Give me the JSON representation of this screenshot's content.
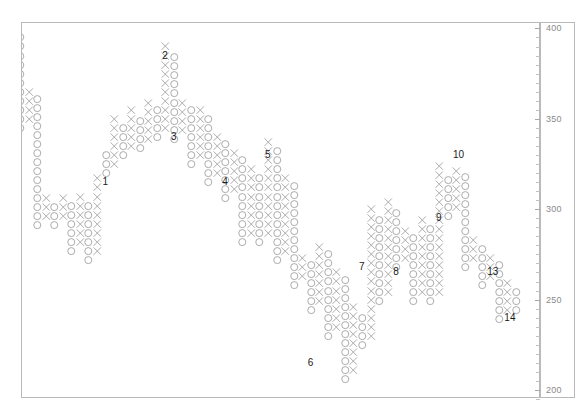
{
  "chart_data": {
    "type": "scatter",
    "chart_kind": "point-and-figure",
    "title": "",
    "xlabel": "",
    "ylabel": "",
    "ylim": [
      195,
      403
    ],
    "y_axis": {
      "position": "right",
      "major_ticks": [
        400,
        350,
        300,
        250,
        200
      ],
      "major_tick_labels": [
        "400",
        "350",
        "300",
        "250",
        "200"
      ],
      "minor_tick_step": 5,
      "grid": false,
      "box_size": 5,
      "reversal": 3
    },
    "x_axis": {
      "ticks": [],
      "tick_labels": [],
      "grid": false,
      "columns_total": 59
    },
    "symbols": {
      "up": "X",
      "down": "O"
    },
    "series_name": "",
    "annotations": [
      {
        "text": "1",
        "x": 10,
        "y": 315
      },
      {
        "text": "2",
        "x": 17,
        "y": 385
      },
      {
        "text": "3",
        "x": 18,
        "y": 340
      },
      {
        "text": "4",
        "x": 24,
        "y": 315
      },
      {
        "text": "5",
        "x": 29,
        "y": 330
      },
      {
        "text": "6",
        "x": 34,
        "y": 215
      },
      {
        "text": "7",
        "x": 40,
        "y": 268
      },
      {
        "text": "8",
        "x": 44,
        "y": 265
      },
      {
        "text": "9",
        "x": 49,
        "y": 295
      },
      {
        "text": "10",
        "x": 51,
        "y": 330
      },
      {
        "text": "13",
        "x": 55,
        "y": 265
      },
      {
        "text": "14",
        "x": 57,
        "y": 240
      }
    ],
    "columns": [
      {
        "dir": "O",
        "x": 0,
        "top": 399,
        "bottom": 345
      },
      {
        "dir": "X",
        "x": 1,
        "top": 369,
        "bottom": 350
      },
      {
        "dir": "O",
        "x": 2,
        "top": 364,
        "bottom": 291
      },
      {
        "dir": "X",
        "x": 3,
        "top": 310,
        "bottom": 296
      },
      {
        "dir": "O",
        "x": 4,
        "top": 305,
        "bottom": 291
      },
      {
        "dir": "X",
        "x": 5,
        "top": 310,
        "bottom": 296
      },
      {
        "dir": "O",
        "x": 6,
        "top": 305,
        "bottom": 277
      },
      {
        "dir": "X",
        "x": 7,
        "top": 310,
        "bottom": 282
      },
      {
        "dir": "O",
        "x": 8,
        "top": 305,
        "bottom": 272
      },
      {
        "dir": "X",
        "x": 9,
        "top": 320,
        "bottom": 277
      },
      {
        "dir": "O",
        "x": 10,
        "top": 334,
        "bottom": 320
      },
      {
        "dir": "X",
        "x": 11,
        "top": 353,
        "bottom": 325
      },
      {
        "dir": "O",
        "x": 12,
        "top": 348,
        "bottom": 330
      },
      {
        "dir": "X",
        "x": 13,
        "top": 358,
        "bottom": 335
      },
      {
        "dir": "O",
        "x": 14,
        "top": 353,
        "bottom": 334
      },
      {
        "dir": "X",
        "x": 15,
        "top": 363,
        "bottom": 339
      },
      {
        "dir": "O",
        "x": 16,
        "top": 358,
        "bottom": 340
      },
      {
        "dir": "X",
        "x": 17,
        "top": 392,
        "bottom": 345
      },
      {
        "dir": "O",
        "x": 18,
        "top": 387,
        "bottom": 339
      },
      {
        "dir": "X",
        "x": 19,
        "top": 363,
        "bottom": 344
      },
      {
        "dir": "O",
        "x": 20,
        "top": 358,
        "bottom": 325
      },
      {
        "dir": "X",
        "x": 21,
        "top": 358,
        "bottom": 330
      },
      {
        "dir": "O",
        "x": 22,
        "top": 353,
        "bottom": 315
      },
      {
        "dir": "X",
        "x": 23,
        "top": 344,
        "bottom": 320
      },
      {
        "dir": "O",
        "x": 24,
        "top": 339,
        "bottom": 306
      },
      {
        "dir": "X",
        "x": 25,
        "top": 334,
        "bottom": 311
      },
      {
        "dir": "O",
        "x": 26,
        "top": 329,
        "bottom": 282
      },
      {
        "dir": "X",
        "x": 27,
        "top": 325,
        "bottom": 287
      },
      {
        "dir": "O",
        "x": 28,
        "top": 320,
        "bottom": 282
      },
      {
        "dir": "X",
        "x": 29,
        "top": 339,
        "bottom": 287
      },
      {
        "dir": "O",
        "x": 30,
        "top": 334,
        "bottom": 272
      },
      {
        "dir": "X",
        "x": 31,
        "top": 320,
        "bottom": 277
      },
      {
        "dir": "O",
        "x": 32,
        "top": 315,
        "bottom": 258
      },
      {
        "dir": "X",
        "x": 33,
        "top": 277,
        "bottom": 263
      },
      {
        "dir": "O",
        "x": 34,
        "top": 272,
        "bottom": 244
      },
      {
        "dir": "X",
        "x": 35,
        "top": 282,
        "bottom": 249
      },
      {
        "dir": "O",
        "x": 36,
        "top": 277,
        "bottom": 230
      },
      {
        "dir": "X",
        "x": 37,
        "top": 268,
        "bottom": 235
      },
      {
        "dir": "O",
        "x": 38,
        "top": 263,
        "bottom": 206
      },
      {
        "dir": "X",
        "x": 39,
        "top": 249,
        "bottom": 211
      },
      {
        "dir": "O",
        "x": 40,
        "top": 244,
        "bottom": 225
      },
      {
        "dir": "X",
        "x": 41,
        "top": 301,
        "bottom": 230
      },
      {
        "dir": "O",
        "x": 42,
        "top": 296,
        "bottom": 249
      },
      {
        "dir": "X",
        "x": 43,
        "top": 306,
        "bottom": 254
      },
      {
        "dir": "O",
        "x": 44,
        "top": 301,
        "bottom": 268
      },
      {
        "dir": "X",
        "x": 45,
        "top": 291,
        "bottom": 273
      },
      {
        "dir": "O",
        "x": 46,
        "top": 287,
        "bottom": 249
      },
      {
        "dir": "X",
        "x": 47,
        "top": 296,
        "bottom": 254
      },
      {
        "dir": "O",
        "x": 48,
        "top": 291,
        "bottom": 249
      },
      {
        "dir": "X",
        "x": 49,
        "top": 325,
        "bottom": 254
      },
      {
        "dir": "O",
        "x": 50,
        "top": 320,
        "bottom": 296
      },
      {
        "dir": "X",
        "x": 51,
        "top": 325,
        "bottom": 301
      },
      {
        "dir": "O",
        "x": 52,
        "top": 320,
        "bottom": 268
      },
      {
        "dir": "X",
        "x": 53,
        "top": 287,
        "bottom": 273
      },
      {
        "dir": "O",
        "x": 54,
        "top": 282,
        "bottom": 258
      },
      {
        "dir": "X",
        "x": 55,
        "top": 277,
        "bottom": 263
      },
      {
        "dir": "O",
        "x": 56,
        "top": 272,
        "bottom": 239
      },
      {
        "dir": "X",
        "x": 57,
        "top": 263,
        "bottom": 244
      },
      {
        "dir": "O",
        "x": 58,
        "top": 258,
        "bottom": 244
      }
    ]
  }
}
